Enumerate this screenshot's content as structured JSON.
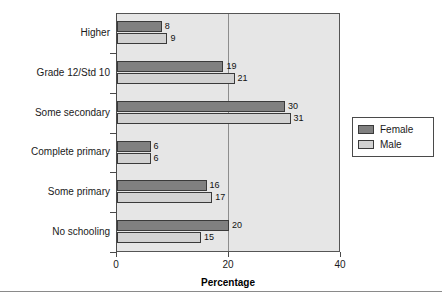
{
  "chart_data": {
    "type": "bar",
    "orientation": "horizontal",
    "title": "",
    "xlabel": "Percentage",
    "ylabel": "",
    "xlim": [
      0,
      40
    ],
    "xticks": [
      "0",
      "20",
      "40"
    ],
    "grid": "vertical gridline at 20",
    "legend_position": "right",
    "categories": [
      "Higher",
      "Grade 12/Std 10",
      "Some secondary",
      "Complete primary",
      "Some primary",
      "No schooling"
    ],
    "series": [
      {
        "name": "Female",
        "color": "#808080",
        "values": [
          8,
          19,
          30,
          6,
          16,
          20
        ]
      },
      {
        "name": "Male",
        "color": "#d2d2d2",
        "values": [
          9,
          21,
          31,
          6,
          17,
          15
        ]
      }
    ]
  },
  "legend": {
    "items": [
      {
        "label": "Female"
      },
      {
        "label": "Male"
      }
    ]
  }
}
